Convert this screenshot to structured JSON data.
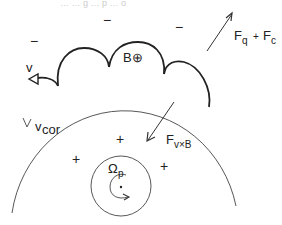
{
  "diagram": {
    "top_cut_text": "… … g … p … o",
    "labels": {
      "B_field": "B⊕",
      "v": "v",
      "v_cor_main": "v",
      "v_cor_sub": "cor",
      "F_q": "F",
      "F_q_sub": "q",
      "plus": "+",
      "F_c": "F",
      "F_c_sub": "c",
      "F_vxB": "F",
      "F_vxB_sub": "v×B",
      "omega": "Ω",
      "omega_sub": "p"
    },
    "charges": {
      "negative": [
        "−",
        "−",
        "−"
      ],
      "positive": [
        "+",
        "+",
        "+"
      ]
    }
  }
}
